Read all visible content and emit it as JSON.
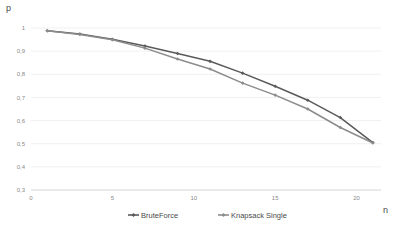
{
  "chart_data": {
    "type": "line",
    "title": "",
    "xlabel": "n",
    "ylabel": "p",
    "xlim": [
      0,
      21.5
    ],
    "ylim": [
      0.3,
      1.0
    ],
    "grid": true,
    "legend_position": "bottom",
    "xticks": [
      0,
      5,
      10,
      15,
      20
    ],
    "xtick_labels": [
      "0",
      "5",
      "10",
      "15",
      "20"
    ],
    "yticks": [
      0.3,
      0.4,
      0.5,
      0.6,
      0.7,
      0.8,
      0.9,
      1.0
    ],
    "ytick_labels": [
      "0,3",
      "0,4",
      "0,5",
      "0,6",
      "0,7",
      "0,8",
      "0,9",
      "1"
    ],
    "x": [
      1,
      3,
      5,
      7,
      9,
      11,
      13,
      15,
      17,
      19,
      21
    ],
    "series": [
      {
        "name": "BruteForce",
        "color": "#5a5a5a",
        "marker": "diamond",
        "values": [
          0.988,
          0.974,
          0.951,
          0.922,
          0.89,
          0.856,
          0.805,
          0.748,
          0.688,
          0.613,
          0.505
        ]
      },
      {
        "name": "Knapsack Single",
        "color": "#8c8c8c",
        "marker": "diamond",
        "values": [
          0.988,
          0.972,
          0.949,
          0.913,
          0.866,
          0.823,
          0.762,
          0.71,
          0.65,
          0.57,
          0.503
        ]
      }
    ]
  },
  "legend": {
    "items": [
      {
        "label": "BruteForce"
      },
      {
        "label": "Knapsack Single"
      }
    ]
  },
  "axis_labels": {
    "y": "p",
    "x": "n"
  },
  "colors": {
    "series_1": "#5a5a5a",
    "series_2": "#8c8c8c",
    "gridline": "#e9e9e9",
    "tick_text": "#8a8a8a",
    "background": "#ffffff"
  }
}
